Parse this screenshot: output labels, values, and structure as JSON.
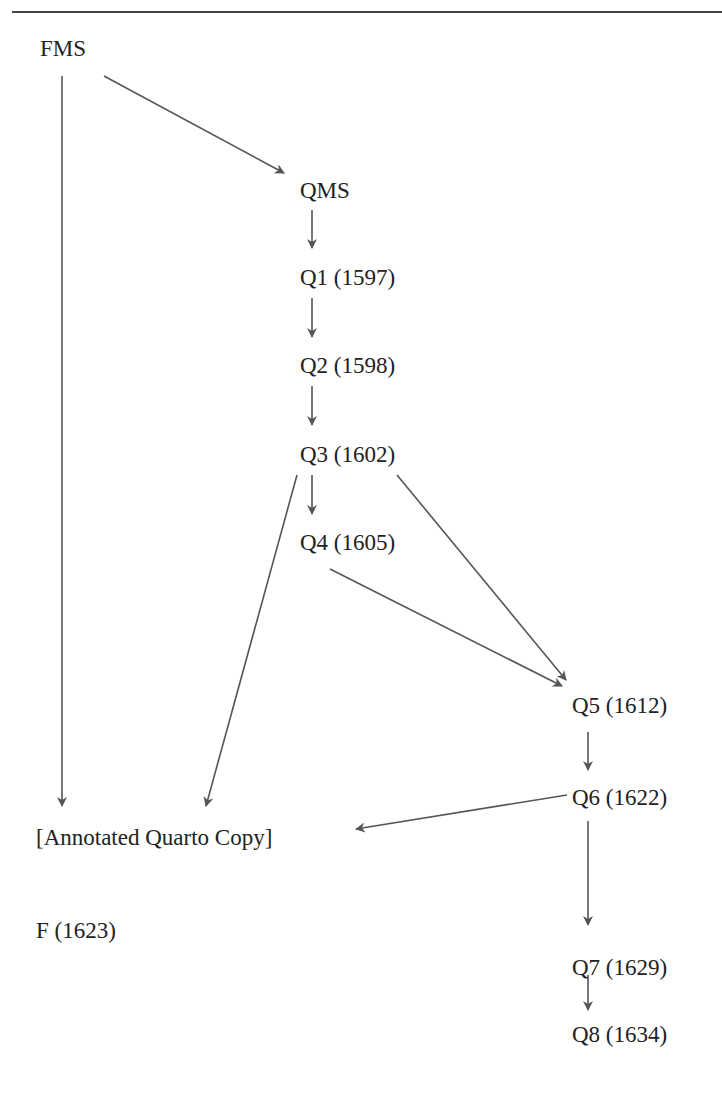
{
  "diagram": {
    "title": "",
    "nodes": [
      {
        "id": "fms",
        "label": "FMS",
        "x": 40,
        "y": 36
      },
      {
        "id": "qms",
        "label": "QMS",
        "x": 300,
        "y": 178
      },
      {
        "id": "q1",
        "label": "Q1 (1597)",
        "x": 300,
        "y": 265
      },
      {
        "id": "q2",
        "label": "Q2 (1598)",
        "x": 300,
        "y": 353
      },
      {
        "id": "q3",
        "label": "Q3 (1602)",
        "x": 300,
        "y": 442
      },
      {
        "id": "q4",
        "label": "Q4 (1605)",
        "x": 300,
        "y": 530
      },
      {
        "id": "q5",
        "label": "Q5 (1612)",
        "x": 572,
        "y": 693
      },
      {
        "id": "q6",
        "label": "Q6 (1622)",
        "x": 572,
        "y": 785
      },
      {
        "id": "aqc",
        "label": "[Annotated Quarto Copy]",
        "x": 36,
        "y": 825
      },
      {
        "id": "f",
        "label": "F (1623)",
        "x": 36,
        "y": 918
      },
      {
        "id": "q7",
        "label": "Q7 (1629)",
        "x": 572,
        "y": 955
      },
      {
        "id": "q8",
        "label": "Q8 (1634)",
        "x": 572,
        "y": 1022
      }
    ],
    "edges": [
      {
        "from": "fms",
        "to": "aqc",
        "x1": 62,
        "y1": 76,
        "x2": 62,
        "y2": 806
      },
      {
        "from": "fms",
        "to": "qms",
        "x1": 104,
        "y1": 76,
        "x2": 284,
        "y2": 173
      },
      {
        "from": "qms",
        "to": "q1",
        "x1": 312,
        "y1": 210,
        "x2": 312,
        "y2": 248
      },
      {
        "from": "q1",
        "to": "q2",
        "x1": 312,
        "y1": 298,
        "x2": 312,
        "y2": 337
      },
      {
        "from": "q2",
        "to": "q3",
        "x1": 312,
        "y1": 386,
        "x2": 312,
        "y2": 425
      },
      {
        "from": "q3",
        "to": "q4",
        "x1": 312,
        "y1": 475,
        "x2": 312,
        "y2": 514
      },
      {
        "from": "q3",
        "to": "aqc",
        "x1": 297,
        "y1": 475,
        "x2": 206,
        "y2": 806
      },
      {
        "from": "q3",
        "to": "q5",
        "x1": 397,
        "y1": 475,
        "x2": 566,
        "y2": 680
      },
      {
        "from": "q4",
        "to": "q5",
        "x1": 330,
        "y1": 569,
        "x2": 562,
        "y2": 686
      },
      {
        "from": "q5",
        "to": "q6",
        "x1": 588,
        "y1": 732,
        "x2": 588,
        "y2": 770
      },
      {
        "from": "q6",
        "to": "aqc",
        "x1": 567,
        "y1": 795,
        "x2": 356,
        "y2": 829
      },
      {
        "from": "q6",
        "to": "q7",
        "x1": 588,
        "y1": 821,
        "x2": 588,
        "y2": 925
      },
      {
        "from": "q7",
        "to": "q8",
        "x1": 588,
        "y1": 975,
        "x2": 588,
        "y2": 1010
      }
    ],
    "colors": {
      "text": "#222222",
      "edge": "#555555",
      "rule": "#444444"
    }
  }
}
